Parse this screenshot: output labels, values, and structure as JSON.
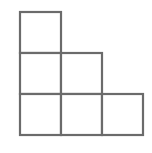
{
  "diagram": {
    "stroke_color": "#6b6b6b",
    "stroke_width": 2.2,
    "fill_color": "#ffffff",
    "cell_size": 41,
    "origin": {
      "x": 20,
      "y": 12
    },
    "cells": [
      {
        "row": 0,
        "col": 0
      },
      {
        "row": 1,
        "col": 0
      },
      {
        "row": 1,
        "col": 1
      },
      {
        "row": 2,
        "col": 0
      },
      {
        "row": 2,
        "col": 1
      },
      {
        "row": 2,
        "col": 2
      }
    ]
  }
}
